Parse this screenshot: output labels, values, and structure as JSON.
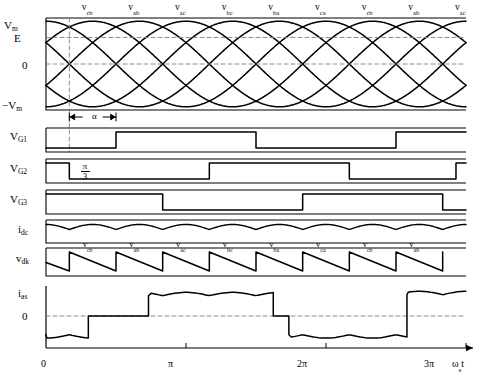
{
  "figure": {
    "x_axis_label": "ωst",
    "x_ticks": [
      "0",
      "π",
      "2π",
      "3π"
    ],
    "stroke_color": "#000000",
    "dash_color": "#808080",
    "background": "#ffffff"
  },
  "supply_plot": {
    "name": "line-to-line supply voltages",
    "y_labels": [
      "V",
      "E",
      "0",
      "−V"
    ],
    "y_label_subs": [
      "m",
      "",
      "",
      "m"
    ],
    "phase_labels": [
      {
        "text": "v",
        "sub": "cb"
      },
      {
        "text": "v",
        "sub": "ab"
      },
      {
        "text": "v",
        "sub": "ac"
      },
      {
        "text": "v",
        "sub": "bc"
      },
      {
        "text": "v",
        "sub": "ba"
      },
      {
        "text": "v",
        "sub": "ca"
      },
      {
        "text": "v",
        "sub": "cb"
      },
      {
        "text": "v",
        "sub": "ab"
      },
      {
        "text": "v",
        "sub": "ac"
      }
    ]
  },
  "gate_signals": [
    {
      "label": "V",
      "sub": "G1"
    },
    {
      "label": "V",
      "sub": "G2"
    },
    {
      "label": "V",
      "sub": "G3"
    }
  ],
  "dc_traces": [
    {
      "label": "i",
      "sub": "dc"
    },
    {
      "label": "v",
      "sub": "dk"
    }
  ],
  "vdk_segment_labels": [
    {
      "text": "v",
      "sub": "cb"
    },
    {
      "text": "v",
      "sub": "ab"
    },
    {
      "text": "v",
      "sub": "ac"
    },
    {
      "text": "v",
      "sub": "bc"
    },
    {
      "text": "v",
      "sub": "ba"
    },
    {
      "text": "v",
      "sub": "ca"
    },
    {
      "text": "v",
      "sub": "cb"
    },
    {
      "text": "v",
      "sub": "ab"
    }
  ],
  "ac_trace": {
    "label": "i",
    "sub": "as",
    "zero_label": "0"
  },
  "annotations": {
    "alpha": "α",
    "pi_over_3_num": "π",
    "pi_over_3_den": "3"
  },
  "chart_data": {
    "type": "line",
    "xlabel": "ωst",
    "xlim": [
      0,
      9.4247779
    ],
    "grid": false,
    "legend": "none",
    "firing_angle_alpha_rad": 1.0471976,
    "panels": [
      {
        "name": "supply_voltages",
        "ylabel": "",
        "ytick_labels": [
          "Vm",
          "E",
          "0",
          "-Vm"
        ],
        "ytick_values": [
          1.0,
          0.62,
          0.0,
          -1.0
        ],
        "ylim": [
          -1.15,
          1.15
        ],
        "series": [
          {
            "name": "v_ab",
            "form": "sin(x + 0.5236)"
          },
          {
            "name": "v_bc",
            "form": "sin(x - 1.5708)"
          },
          {
            "name": "v_ca",
            "form": "sin(x + 2.6180)"
          },
          {
            "name": "v_ba",
            "form": "-sin(x + 0.5236)"
          },
          {
            "name": "v_cb",
            "form": "-sin(x - 1.5708)"
          },
          {
            "name": "v_ac",
            "form": "-sin(x + 2.6180)"
          }
        ],
        "segment_labels": [
          "v_cb",
          "v_ab",
          "v_ac",
          "v_bc",
          "v_ba",
          "v_ca",
          "v_cb",
          "v_ab",
          "v_ac"
        ]
      },
      {
        "name": "VG1",
        "type": "square",
        "ylim": [
          0,
          1
        ],
        "transitions_rad": [
          1.5708,
          4.7124,
          7.854
        ],
        "initial_state": 0,
        "duty": 0.5
      },
      {
        "name": "VG2",
        "type": "square",
        "ylim": [
          0,
          1
        ],
        "transitions_rad": [
          0.5236,
          3.6652,
          6.8068,
          9.2
        ],
        "initial_state": 1,
        "duty": 0.5
      },
      {
        "name": "VG3",
        "type": "square",
        "ylim": [
          0,
          1
        ],
        "transitions_rad": [
          2.618,
          5.7596,
          8.9012
        ],
        "initial_state": 1,
        "duty": 0.5
      },
      {
        "name": "i_dc",
        "type": "ripple",
        "ylim": [
          0,
          1
        ],
        "mean": 0.82,
        "ripple_amplitude": 0.16,
        "ripple_period_rad": 1.0472
      },
      {
        "name": "v_dk",
        "type": "sawtooth_decay",
        "ylim": [
          0,
          1
        ],
        "period_rad": 1.0472,
        "peak": 0.88,
        "trough": 0.12,
        "segment_labels": [
          "v_cb",
          "v_ab",
          "v_ac",
          "v_bc",
          "v_ba",
          "v_ca",
          "v_cb",
          "v_ab"
        ]
      },
      {
        "name": "i_as",
        "type": "quasi_square",
        "ylim": [
          -1.1,
          1.1
        ],
        "zero_line": 0,
        "conduction_blocks": [
          {
            "start_rad": 0.0,
            "end_rad": 0.95,
            "level": -0.72
          },
          {
            "start_rad": 0.95,
            "end_rad": 2.3,
            "level": 0.0
          },
          {
            "start_rad": 2.3,
            "end_rad": 5.1,
            "level": 0.78
          },
          {
            "start_rad": 5.1,
            "end_rad": 5.45,
            "level": 0.0
          },
          {
            "start_rad": 5.45,
            "end_rad": 8.1,
            "level": -0.72
          },
          {
            "start_rad": 8.1,
            "end_rad": 9.42,
            "level": 0.82
          }
        ]
      }
    ]
  }
}
